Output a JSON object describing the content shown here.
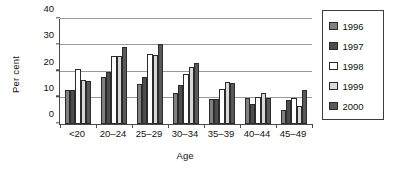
{
  "chart_data": {
    "type": "bar",
    "title": "",
    "xlabel": "Age",
    "ylabel": "Per cent",
    "categories": [
      "<20",
      "20–24",
      "25–29",
      "30–34",
      "35–39",
      "40–44",
      "45–49"
    ],
    "series": [
      {
        "name": "1996",
        "color": "#808080",
        "values": [
          13.0,
          17.8,
          15.4,
          12.0,
          9.7,
          10.1,
          5.5
        ]
      },
      {
        "name": "1997",
        "color": "#4d4d4d",
        "values": [
          13.0,
          20.0,
          18.0,
          15.0,
          9.7,
          7.7,
          9.0
        ]
      },
      {
        "name": "1998",
        "color": "#ffffff",
        "values": [
          21.0,
          26.0,
          26.7,
          19.2,
          13.4,
          10.4,
          9.9
        ]
      },
      {
        "name": "1999",
        "color": "#d9d9d9",
        "values": [
          16.7,
          25.8,
          26.3,
          21.7,
          16.0,
          11.8,
          7.0
        ]
      },
      {
        "name": "2000",
        "color": "#595959",
        "values": [
          16.3,
          29.2,
          30.6,
          23.2,
          15.7,
          9.9,
          13.0
        ]
      }
    ],
    "ylim": [
      0,
      40
    ],
    "yticks": [
      0,
      10,
      20,
      30,
      40
    ],
    "ytick_labels": [
      "0",
      "10",
      "20",
      "30",
      "40"
    ],
    "grid": "horizontal",
    "legend_position": "right",
    "bar_border_color": "#2b2b2b",
    "axis_color": "#4a4a4a",
    "gridline_color": "#9a9a9a"
  }
}
